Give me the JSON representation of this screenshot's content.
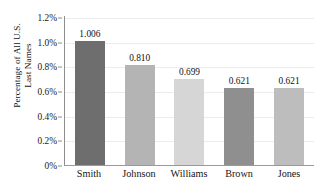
{
  "chart_data": {
    "type": "bar",
    "title": "",
    "xlabel": "",
    "ylabel": "Percentage of All U.S. Last Names",
    "ylabel_line1": "Percentage of All U.S.",
    "ylabel_line2": "Last Names",
    "categories": [
      "Smith",
      "Johnson",
      "Williams",
      "Brown",
      "Jones"
    ],
    "values": [
      1.006,
      0.81,
      0.699,
      0.621,
      0.621
    ],
    "value_labels": [
      "1.006",
      "0.810",
      "0.699",
      "0.621",
      "0.621"
    ],
    "bar_colors": [
      "#6e6e6e",
      "#b4b4b4",
      "#d6d6d6",
      "#8f8f8f",
      "#bdbdbd"
    ],
    "ylim": [
      0,
      1.2
    ],
    "ytick_values": [
      1.2,
      1.0,
      0.8,
      0.6,
      0.4,
      0.2,
      0
    ],
    "ytick_labels": [
      "1.2%",
      "1.0%",
      "0.8%",
      "0.6%",
      "0.4%",
      "0.2%",
      "0%"
    ],
    "grid": true,
    "legend": "none",
    "units": "percent"
  },
  "axis": {
    "line_color": "#8d8d8d",
    "grid_color": "#ececec"
  }
}
